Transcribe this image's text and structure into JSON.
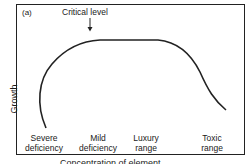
{
  "figure": {
    "panel_label": "(a)",
    "annotation": "Critical level",
    "y_axis_label": "Growth",
    "x_axis_label": "Concentration of element",
    "zones": [
      {
        "line1": "Severe",
        "line2": "deficiency"
      },
      {
        "line1": "Mild",
        "line2": "deficiency"
      },
      {
        "line1": "Luxury",
        "line2": "range"
      },
      {
        "line1": "Toxic",
        "line2": "range"
      }
    ],
    "line_color": "#222222"
  }
}
